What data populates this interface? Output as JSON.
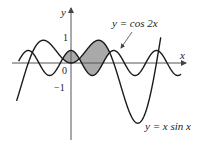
{
  "figure": {
    "axes": {
      "x_label": "x",
      "y_label": "y",
      "origin_label": "0",
      "y_tick_pos_label": "1",
      "y_tick_neg_label": "−1"
    },
    "curves": [
      {
        "name": "cos2x",
        "label": "y = cos 2x",
        "expr": "cos(2x)"
      },
      {
        "name": "xsinx",
        "label": "y = x sin x",
        "expr": "x*sin(x)"
      }
    ],
    "shaded_region": {
      "from_x": -0.61,
      "to_x": 2.83,
      "description": "region between y = cos 2x and y = x sin x"
    },
    "colors": {
      "curve": "#1a1a1a",
      "axis": "#555555",
      "shade": "#a9a9a9"
    },
    "mapping": {
      "origin_px": [
        71,
        63
      ],
      "scale_x": 13.6,
      "scale_y": 12.5,
      "x_min": -4.35,
      "x_max": 8.4
    }
  }
}
